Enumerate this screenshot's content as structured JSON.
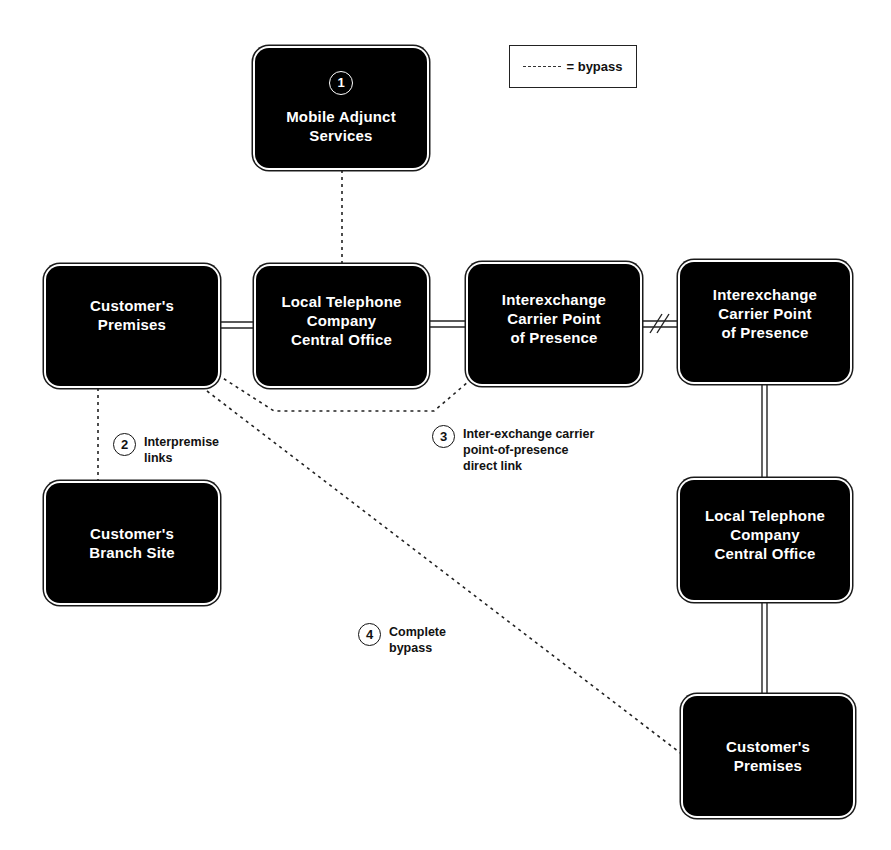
{
  "legend": {
    "symbol": "dashed-line",
    "label": "= bypass"
  },
  "nodes": [
    {
      "id": "mobile-adjunct-services",
      "number": "1",
      "label": "Mobile Adjunct\nServices"
    },
    {
      "id": "customers-premises-origin",
      "label": "Customer's\nPremises"
    },
    {
      "id": "local-telephone-co-origin",
      "label": "Local Telephone\nCompany\nCentral Office"
    },
    {
      "id": "ixc-pop-origin",
      "label": "Interexchange\nCarrier Point\nof Presence"
    },
    {
      "id": "ixc-pop-destination",
      "label": "Interexchange\nCarrier Point\nof Presence"
    },
    {
      "id": "local-telephone-co-destination",
      "label": "Local Telephone\nCompany\nCentral Office"
    },
    {
      "id": "customers-branch-site",
      "label": "Customer's\nBranch Site"
    },
    {
      "id": "customers-premises-destination",
      "label": "Customer's\nPremises"
    }
  ],
  "callouts": [
    {
      "number": "2",
      "text": "Interpremise\nlinks"
    },
    {
      "number": "3",
      "text": "Inter-exchange carrier\npoint-of-presence\ndirect link"
    },
    {
      "number": "4",
      "text": "Complete\nbypass"
    }
  ],
  "connections": {
    "solid": [
      "customers-premises-origin -> local-telephone-co-origin",
      "local-telephone-co-origin -> ixc-pop-origin",
      "ixc-pop-origin -> ixc-pop-destination (long-distance break)",
      "ixc-pop-destination -> local-telephone-co-destination",
      "local-telephone-co-destination -> customers-premises-destination"
    ],
    "bypass": [
      "mobile-adjunct-services -> local-telephone-co-origin",
      "customers-premises-origin -> customers-branch-site",
      "customers-premises-origin -> ixc-pop-origin",
      "customers-premises-origin -> customers-premises-destination"
    ]
  },
  "colors": {
    "box_fill": "#000000",
    "box_text": "#ffffff",
    "line": "#222222",
    "background": "#ffffff"
  }
}
